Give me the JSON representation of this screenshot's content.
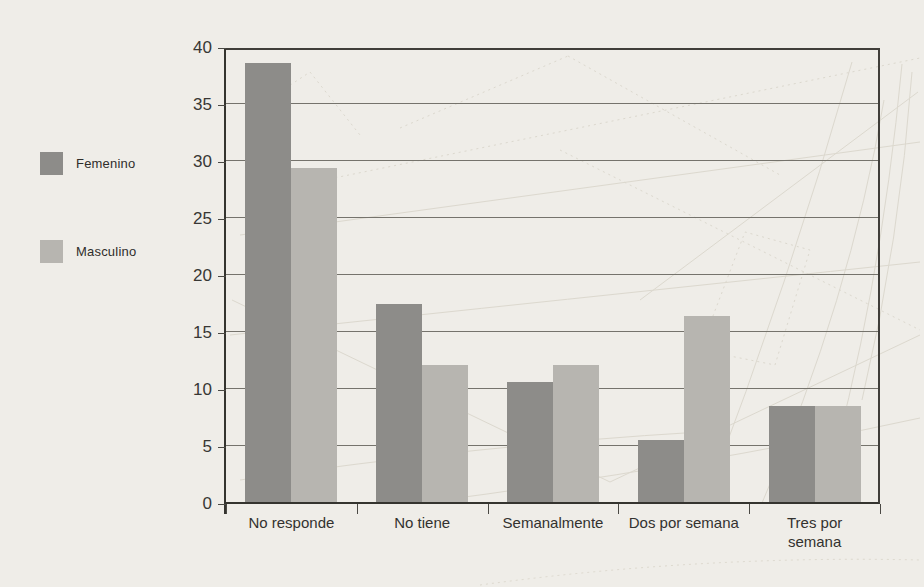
{
  "page": {
    "background_color": "#efede8",
    "text_color": "#33322f"
  },
  "legend": {
    "position": "left",
    "items": [
      {
        "label": "Femenino",
        "color": "#8d8c89"
      },
      {
        "label": "Masculino",
        "color": "#b7b5b0"
      }
    ]
  },
  "chart_data": {
    "type": "bar",
    "title": "",
    "subtitle": "",
    "xlabel": "",
    "ylabel": "",
    "categories": [
      "No responde",
      "No tiene",
      "Semanalmente",
      "Dos por semana",
      "Tres por semana"
    ],
    "series": [
      {
        "name": "Femenino",
        "color": "#8d8c89",
        "values": [
          38.5,
          17.4,
          10.5,
          5.4,
          8.4
        ]
      },
      {
        "name": "Masculino",
        "color": "#b7b5b0",
        "values": [
          29.3,
          12.0,
          12.0,
          16.3,
          8.4
        ]
      }
    ],
    "ylim": [
      0,
      40
    ],
    "yticks": [
      0,
      5,
      10,
      15,
      20,
      25,
      30,
      35,
      40
    ],
    "grid": true,
    "gridline_color": "#75736c",
    "axis_color": "#35342f",
    "legend_position": "left"
  }
}
